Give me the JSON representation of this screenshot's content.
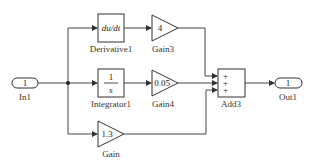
{
  "diagram": {
    "type": "simulink-block-diagram",
    "blocks": {
      "in1": {
        "label": "In1",
        "port": "1"
      },
      "derivative": {
        "label": "Derivative1",
        "content": "du/dt"
      },
      "integrator": {
        "label": "Integrator1",
        "numerator": "1",
        "denominator": "s"
      },
      "gain3": {
        "label": "Gain3",
        "value": "4"
      },
      "gain4": {
        "label": "Gain4",
        "value": "0.05"
      },
      "gain": {
        "label": "Gain",
        "value": "1.3"
      },
      "add3": {
        "label": "Add3",
        "signs": [
          "+",
          "+",
          "+"
        ]
      },
      "out1": {
        "label": "Out1",
        "port": "1"
      }
    },
    "connections": [
      {
        "from": "In1",
        "to": "Derivative1"
      },
      {
        "from": "In1",
        "to": "Integrator1"
      },
      {
        "from": "In1",
        "to": "Gain"
      },
      {
        "from": "Derivative1",
        "to": "Gain3"
      },
      {
        "from": "Integrator1",
        "to": "Gain4"
      },
      {
        "from": "Gain3",
        "to": "Add3 input 1"
      },
      {
        "from": "Gain4",
        "to": "Add3 input 2"
      },
      {
        "from": "Gain",
        "to": "Add3 input 3"
      },
      {
        "from": "Add3",
        "to": "Out1"
      }
    ],
    "colors": {
      "line": "#444444",
      "background": "#ffffff"
    }
  }
}
